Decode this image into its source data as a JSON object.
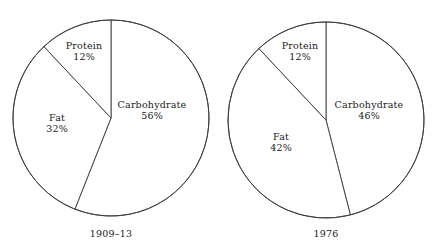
{
  "figure": {
    "background_color": "#ffffff",
    "line_color": "#3a3a3a",
    "text_color": "#1a1a1a"
  },
  "chart_data": [
    {
      "type": "pie",
      "title": "1909–13",
      "caption": "1909–13",
      "categories": [
        "Carbohydrate",
        "Fat",
        "Protein"
      ],
      "values": [
        56,
        32,
        12
      ],
      "value_labels": [
        "56%",
        "32%",
        "12%"
      ],
      "units": "percent",
      "start_angle_deg": 0,
      "direction": "clockwise",
      "legend": "none",
      "grid": false,
      "center": {
        "x": 111,
        "y": 118
      },
      "radius": 98,
      "slices": [
        {
          "label": "Carbohydrate",
          "percent": 56,
          "percent_label": "56%",
          "label_x": 152,
          "label_y": 99
        },
        {
          "label": "Fat",
          "percent": 32,
          "percent_label": "32%",
          "label_x": 57,
          "label_y": 112
        },
        {
          "label": "Protein",
          "percent": 12,
          "percent_label": "12%",
          "label_x": 84,
          "label_y": 40
        }
      ]
    },
    {
      "type": "pie",
      "title": "1976",
      "caption": "1976",
      "categories": [
        "Carbohydrate",
        "Fat",
        "Protein"
      ],
      "values": [
        46,
        42,
        12
      ],
      "value_labels": [
        "46%",
        "42%",
        "12%"
      ],
      "units": "percent",
      "start_angle_deg": 0,
      "direction": "clockwise",
      "legend": "none",
      "grid": false,
      "center": {
        "x": 326,
        "y": 120
      },
      "radius": 98,
      "slices": [
        {
          "label": "Carbohydrate",
          "percent": 46,
          "percent_label": "46%",
          "label_x": 369,
          "label_y": 99
        },
        {
          "label": "Fat",
          "percent": 42,
          "percent_label": "42%",
          "label_x": 281,
          "label_y": 131
        },
        {
          "label": "Protein",
          "percent": 12,
          "percent_label": "12%",
          "label_x": 300,
          "label_y": 40
        }
      ]
    }
  ],
  "charts": {
    "left": {
      "caption": "1909–13",
      "slices": {
        "carbohydrate": {
          "name": "Carbohydrate",
          "pct": "56%"
        },
        "fat": {
          "name": "Fat",
          "pct": "32%"
        },
        "protein": {
          "name": "Protein",
          "pct": "12%"
        }
      }
    },
    "right": {
      "caption": "1976",
      "slices": {
        "carbohydrate": {
          "name": "Carbohydrate",
          "pct": "46%"
        },
        "fat": {
          "name": "Fat",
          "pct": "42%"
        },
        "protein": {
          "name": "Protein",
          "pct": "12%"
        }
      }
    }
  }
}
